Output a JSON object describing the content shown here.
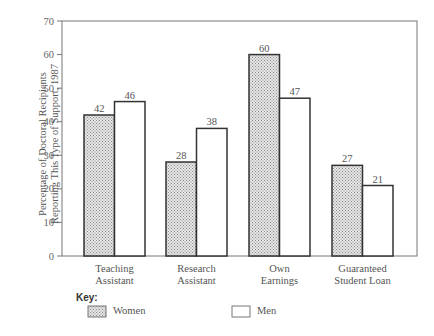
{
  "chart_data": {
    "type": "bar",
    "title": "",
    "xlabel": "",
    "ylabel": "Percentage of Doctoral Recipients Reporting This Type of Support, 1987",
    "ylabel_lines": [
      "Percentage of Doctoral Recipients",
      "Reporting This Type of Support, 1987"
    ],
    "ylim": [
      0,
      70
    ],
    "yticks": [
      0,
      10,
      20,
      30,
      40,
      50,
      60,
      70
    ],
    "grid": false,
    "categories": [
      "Teaching Assistant",
      "Research Assistant",
      "Own Earnings",
      "Guaranteed Student Loan"
    ],
    "category_lines": [
      [
        "Teaching",
        "Assistant"
      ],
      [
        "Research",
        "Assistant"
      ],
      [
        "Own",
        "Earnings"
      ],
      [
        "Guaranteed",
        "Student Loan"
      ]
    ],
    "series": [
      {
        "name": "Women",
        "values": [
          42,
          28,
          60,
          27
        ],
        "fill": "crosshatch"
      },
      {
        "name": "Men",
        "values": [
          46,
          38,
          47,
          21
        ],
        "fill": "#ffffff"
      }
    ],
    "legend": {
      "title": "Key:",
      "position": "bottom",
      "entries": [
        "Women",
        "Men"
      ]
    }
  },
  "legend": {
    "title": "Key:",
    "women": "Women",
    "men": "Men"
  },
  "yaxis": {
    "label_line1": "Percentage of Doctoral Recipients",
    "label_line2": "Reporting This Type of Support, 1987"
  },
  "categories": [
    {
      "line1": "Teaching",
      "line2": "Assistant"
    },
    {
      "line1": "Research",
      "line2": "Assistant"
    },
    {
      "line1": "Own",
      "line2": "Earnings"
    },
    {
      "line1": "Guaranteed",
      "line2": "Student Loan"
    }
  ]
}
